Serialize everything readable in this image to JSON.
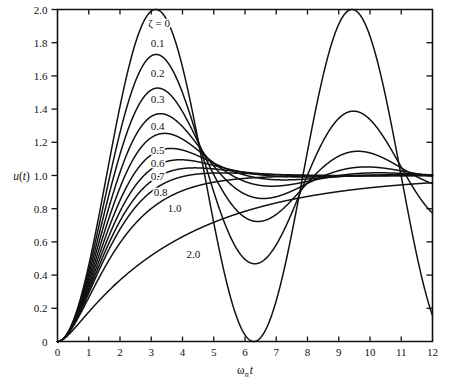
{
  "chart_data": {
    "type": "line",
    "title": "",
    "subtitle": "",
    "xlabel": "ωₙt",
    "ylabel": "u(t)",
    "xlim": [
      0,
      12
    ],
    "ylim": [
      0,
      2.0
    ],
    "grid": false,
    "legend_position": "inline-curve-labels",
    "x_ticks": [
      "0",
      "1",
      "2",
      "3",
      "4",
      "5",
      "6",
      "7",
      "8",
      "9",
      "10",
      "11",
      "12"
    ],
    "x_tick_values": [
      0,
      1,
      2,
      3,
      4,
      5,
      6,
      7,
      8,
      9,
      10,
      11,
      12
    ],
    "y_ticks": [
      "0",
      "0.2",
      "0.4",
      "0.6",
      "0.8",
      "1.0",
      "1.2",
      "1.4",
      "1.6",
      "1.8",
      "2.0"
    ],
    "y_tick_values": [
      0,
      0.2,
      0.4,
      0.6,
      0.8,
      1.0,
      1.2,
      1.4,
      1.6,
      1.8,
      2.0
    ],
    "annotations": [
      {
        "text": "ζ = 0",
        "x": 3.25,
        "y": 1.92
      },
      {
        "text": "0.1",
        "x": 3.2,
        "y": 1.8
      },
      {
        "text": "0.2",
        "x": 3.2,
        "y": 1.62
      },
      {
        "text": "0.3",
        "x": 3.2,
        "y": 1.46
      },
      {
        "text": "0.4",
        "x": 3.2,
        "y": 1.3
      },
      {
        "text": "0.5",
        "x": 3.2,
        "y": 1.155
      },
      {
        "text": "0.6",
        "x": 3.2,
        "y": 1.075
      },
      {
        "text": "0.7",
        "x": 3.2,
        "y": 0.995
      },
      {
        "text": "0.8",
        "x": 3.3,
        "y": 0.9
      },
      {
        "text": "1.0",
        "x": 3.75,
        "y": 0.805
      },
      {
        "text": "2.0",
        "x": 4.35,
        "y": 0.525
      }
    ],
    "series": [
      {
        "name": "ζ = 0",
        "zeta": 0.0,
        "peak_value": 2.0,
        "peak_x": 3.14
      },
      {
        "name": "0.1",
        "zeta": 0.1,
        "peak_value": 1.729,
        "peak_x": 3.16
      },
      {
        "name": "0.2",
        "zeta": 0.2,
        "peak_value": 1.527,
        "peak_x": 3.21
      },
      {
        "name": "0.3",
        "zeta": 0.3,
        "peak_value": 1.372,
        "peak_x": 3.29
      },
      {
        "name": "0.4",
        "zeta": 0.4,
        "peak_value": 1.254,
        "peak_x": 3.43
      },
      {
        "name": "0.5",
        "zeta": 0.5,
        "peak_value": 1.163,
        "peak_x": 3.63
      },
      {
        "name": "0.6",
        "zeta": 0.6,
        "peak_value": 1.095,
        "peak_x": 3.93
      },
      {
        "name": "0.7",
        "zeta": 0.7,
        "peak_value": 1.046,
        "peak_x": 4.4
      },
      {
        "name": "0.8",
        "zeta": 0.8,
        "peak_value": 1.015,
        "peak_x": 5.24
      },
      {
        "name": "1.0",
        "zeta": 1.0,
        "peak_value": 1.0,
        "peak_x": 12.0
      },
      {
        "name": "2.0",
        "zeta": 2.0,
        "peak_value": 1.0,
        "peak_x": 12.0
      }
    ],
    "equation": "u(t) = 1 - e^{-ζωₙt}[cos(ωₑt) + (ζ/√(1-ζ²)) sin(ωₑt)]",
    "colors": {
      "curve": "#111111",
      "axis": "#111111",
      "background": "#ffffff"
    }
  },
  "figure": {
    "xaxis_title": "ωₙt",
    "yaxis_title": "u(t)"
  }
}
